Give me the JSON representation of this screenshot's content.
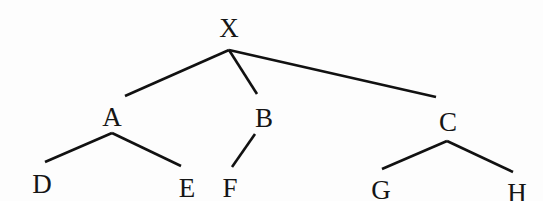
{
  "diagram": {
    "type": "tree",
    "root": "X",
    "nodes": [
      {
        "id": "X",
        "label": "X",
        "x": 229,
        "y": 37
      },
      {
        "id": "A",
        "label": "A",
        "x": 112,
        "y": 126
      },
      {
        "id": "B",
        "label": "B",
        "x": 264,
        "y": 127
      },
      {
        "id": "C",
        "label": "C",
        "x": 448,
        "y": 131
      },
      {
        "id": "D",
        "label": "D",
        "x": 42,
        "y": 193
      },
      {
        "id": "E",
        "label": "E",
        "x": 187,
        "y": 197
      },
      {
        "id": "F",
        "label": "F",
        "x": 230,
        "y": 197
      },
      {
        "id": "G",
        "label": "G",
        "x": 381,
        "y": 199
      },
      {
        "id": "H",
        "label": "H",
        "x": 517,
        "y": 202
      }
    ],
    "edges": [
      {
        "from": "X",
        "to": "A",
        "x1": 229,
        "y1": 50,
        "x2": 125,
        "y2": 96
      },
      {
        "from": "X",
        "to": "B",
        "x1": 229,
        "y1": 50,
        "x2": 257,
        "y2": 94
      },
      {
        "from": "X",
        "to": "C",
        "x1": 229,
        "y1": 50,
        "x2": 436,
        "y2": 97
      },
      {
        "from": "A",
        "to": "D",
        "x1": 112,
        "y1": 133,
        "x2": 45,
        "y2": 162
      },
      {
        "from": "A",
        "to": "E",
        "x1": 112,
        "y1": 133,
        "x2": 181,
        "y2": 166
      },
      {
        "from": "B",
        "to": "F",
        "x1": 255,
        "y1": 134,
        "x2": 232,
        "y2": 167
      },
      {
        "from": "C",
        "to": "G",
        "x1": 447,
        "y1": 141,
        "x2": 382,
        "y2": 169
      },
      {
        "from": "C",
        "to": "H",
        "x1": 447,
        "y1": 141,
        "x2": 513,
        "y2": 172
      }
    ]
  }
}
